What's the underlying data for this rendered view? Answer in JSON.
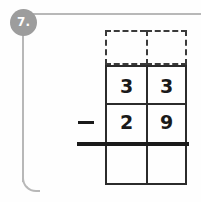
{
  "worksheet": {
    "question_number": "7.",
    "badge_color": "#9d9d9d",
    "rule_color": "#b8b8b8",
    "ink_color": "#1a1a1a",
    "background_color": "#fefefe"
  },
  "problem": {
    "operator": "−",
    "operator_name": "minus-sign",
    "columns": [
      "tens",
      "ones"
    ],
    "rows": [
      {
        "name": "carry-row",
        "style": "dashed",
        "cells": [
          "",
          ""
        ]
      },
      {
        "name": "minuend-row",
        "style": "solid",
        "cells": [
          "3",
          "3"
        ]
      },
      {
        "name": "subtrahend-row",
        "style": "solid",
        "cells": [
          "2",
          "9"
        ]
      },
      {
        "name": "answer-row",
        "style": "solid",
        "cells": [
          "",
          ""
        ]
      }
    ],
    "minuend": "33",
    "subtrahend": "29",
    "answer": ""
  }
}
